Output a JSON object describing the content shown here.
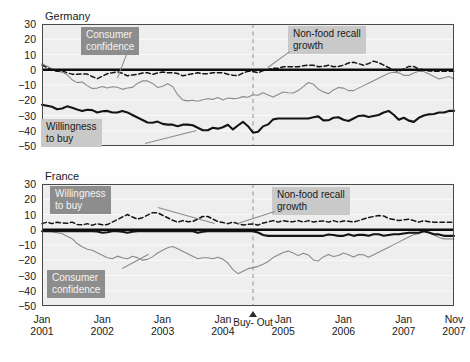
{
  "figure": {
    "panels": [
      {
        "id": "germany",
        "title": "Germany",
        "y_ticks": [
          "30",
          "20",
          "10",
          "0",
          "-10",
          "-20",
          "-30",
          "-40",
          "-50"
        ],
        "callouts": [
          {
            "name": "consumer-confidence-label",
            "text": "Consumer\nconfidence",
            "style": "dark"
          },
          {
            "name": "willingness-to-buy-label",
            "text": "Willingness\nto buy",
            "style": "light"
          },
          {
            "name": "non-food-recall-growth-label",
            "text": "Non-food recall\ngrowth",
            "style": "light"
          }
        ]
      },
      {
        "id": "france",
        "title": "France",
        "y_ticks": [
          "30",
          "20",
          "10",
          "0",
          "-10",
          "-20",
          "-30",
          "-40",
          "-50"
        ],
        "callouts": [
          {
            "name": "willingness-to-buy-label",
            "text": "Willingness\nto buy",
            "style": "dark"
          },
          {
            "name": "consumer-confidence-label",
            "text": "Consumer\nconfidence",
            "style": "dark"
          },
          {
            "name": "non-food-recall-growth-label",
            "text": "Non-food recall\ngrowth",
            "style": "light"
          }
        ]
      }
    ],
    "x_labels": [
      {
        "top": "Jan",
        "bottom": "2001"
      },
      {
        "top": "Jan",
        "bottom": "2002"
      },
      {
        "top": "Jan",
        "bottom": "2003"
      },
      {
        "top": "Jan",
        "bottom": "2004"
      },
      {
        "top": "Jan",
        "bottom": "2005"
      },
      {
        "top": "Jan",
        "bottom": "2006"
      },
      {
        "top": "Jan",
        "bottom": "2007"
      },
      {
        "top": "Nov",
        "bottom": "2007"
      }
    ],
    "event_marker": {
      "name": "buy-out-marker",
      "line1": "Buy-",
      "line2": "Out",
      "icon": "triangle-up-icon"
    },
    "colors": {
      "consumer_confidence": "#8a8a8a",
      "willingness_to_buy": "#141414",
      "non_food_recall_growth": "#141414",
      "zero_line": "#0d0d0d",
      "plot_background": "#eeeeee",
      "grid": "#fbfbfb",
      "callout_light": "#c9c9c9",
      "callout_dark": "#8d8d8d"
    }
  },
  "chart_data": {
    "type": "line",
    "xlabel": "",
    "ylabel": "",
    "ylim": [
      -50,
      30
    ],
    "ytick_step": 10,
    "grid": true,
    "legend": "inline-callout-labels",
    "x_unit": "month",
    "x_start": "2001-01",
    "x_end": "2007-11",
    "x_tick_labels": [
      "Jan 2001",
      "Jan 2002",
      "Jan 2003",
      "Jan 2004",
      "Jan 2005",
      "Jan 2006",
      "Jan 2007",
      "Nov 2007"
    ],
    "annotations": [
      {
        "label": "Buy-Out",
        "x": "2004-07",
        "type": "vertical-dashed-line-with-triangle-marker"
      }
    ],
    "panels": [
      {
        "name": "Germany",
        "series": [
          {
            "name": "Consumer confidence",
            "style": "thin-solid-gray",
            "values": [
              4,
              3,
              2,
              1,
              0,
              -1,
              -1,
              -2,
              -3,
              -5,
              -7,
              -8,
              -9,
              -8,
              -9,
              -11,
              -12,
              -13,
              -12,
              -11,
              -11,
              -12,
              -12,
              -11,
              -11,
              -12,
              -13,
              -12,
              -12,
              -12,
              -11,
              -9,
              -8,
              -7,
              -7,
              -8,
              -9,
              -11,
              -12,
              -11,
              -10,
              -9,
              -10,
              -12,
              -16,
              -19,
              -20,
              -20,
              -21,
              -20,
              -20,
              -21,
              -20,
              -19,
              -19,
              -20,
              -19,
              -18,
              -19,
              -20,
              -19,
              -18,
              -19,
              -18,
              -19,
              -18,
              -17,
              -18,
              -17,
              -16,
              -17,
              -16,
              -15,
              -16,
              -17,
              -18,
              -17,
              -16,
              -15,
              -14,
              -15,
              -16,
              -15,
              -14,
              -13,
              -11,
              -9,
              -8,
              -9,
              -11,
              -13,
              -14,
              -15,
              -16,
              -14,
              -13,
              -12,
              -11,
              -12,
              -13,
              -14,
              -14,
              -13,
              -12,
              -11,
              -10,
              -9,
              -8,
              -7,
              -6,
              -5,
              -4,
              -3,
              -2,
              -2,
              -1,
              -2,
              -3,
              -4,
              -4,
              -3,
              -2,
              -1,
              -1,
              -1,
              -2,
              -3,
              -4,
              -5,
              -6,
              -6,
              -5,
              -4,
              -5,
              -6
            ]
          },
          {
            "name": "Willingness to buy",
            "style": "thick-solid-black",
            "values": [
              -23,
              -23,
              -24,
              -24,
              -25,
              -26,
              -26,
              -25,
              -24,
              -24,
              -25,
              -26,
              -26,
              -27,
              -27,
              -26,
              -26,
              -27,
              -28,
              -28,
              -27,
              -27,
              -27,
              -28,
              -28,
              -28,
              -27,
              -27,
              -28,
              -29,
              -30,
              -31,
              -32,
              -33,
              -34,
              -35,
              -35,
              -34,
              -34,
              -35,
              -36,
              -36,
              -36,
              -36,
              -37,
              -37,
              -36,
              -36,
              -36,
              -36,
              -37,
              -38,
              -39,
              -40,
              -40,
              -39,
              -38,
              -38,
              -39,
              -38,
              -37,
              -36,
              -38,
              -40,
              -37,
              -35,
              -34,
              -36,
              -38,
              -41,
              -43,
              -40,
              -38,
              -36,
              -36,
              -34,
              -32,
              -32,
              -32,
              -32,
              -32,
              -32,
              -32,
              -32,
              -32,
              -32,
              -32,
              -32,
              -32,
              -31,
              -30,
              -31,
              -33,
              -34,
              -33,
              -32,
              -31,
              -31,
              -32,
              -33,
              -34,
              -33,
              -32,
              -31,
              -30,
              -30,
              -30,
              -31,
              -31,
              -30,
              -30,
              -29,
              -28,
              -27,
              -27,
              -29,
              -31,
              -33,
              -32,
              -31,
              -33,
              -35,
              -34,
              -32,
              -31,
              -30,
              -30,
              -29,
              -29,
              -29,
              -28,
              -28,
              -28,
              -27,
              -27,
              -27
            ]
          },
          {
            "name": "Non-food recall growth",
            "style": "dashed-black",
            "values": [
              3,
              2,
              1,
              0,
              -1,
              -1,
              0,
              -1,
              -2,
              -2,
              -3,
              -3,
              -3,
              -3,
              -2,
              -3,
              -4,
              -5,
              -6,
              -5,
              -4,
              -3,
              -2,
              -2,
              -2,
              -1,
              -2,
              -3,
              -4,
              -4,
              -3,
              -3,
              -3,
              -2,
              -2,
              -2,
              -3,
              -3,
              -2,
              -2,
              -1,
              -2,
              -2,
              -2,
              -2,
              -3,
              -4,
              -4,
              -3,
              -3,
              -2,
              -2,
              -2,
              -3,
              -3,
              -2,
              -2,
              -2,
              -2,
              -2,
              -2,
              -3,
              -3,
              -4,
              -4,
              -3,
              -2,
              -1,
              -1,
              -1,
              -2,
              -2,
              -1,
              0,
              0,
              1,
              1,
              1,
              1,
              2,
              2,
              2,
              2,
              2,
              2,
              2,
              3,
              3,
              3,
              3,
              2,
              2,
              2,
              3,
              3,
              2,
              2,
              2,
              3,
              3,
              4,
              5,
              5,
              4,
              4,
              3,
              3,
              4,
              5,
              6,
              5,
              4,
              3,
              2,
              1,
              0,
              -1,
              -1,
              0,
              1,
              2,
              3,
              2,
              1,
              0,
              0,
              0,
              -1,
              -1,
              -1,
              -1,
              -1,
              -1,
              -1,
              -1,
              -1
            ]
          }
        ]
      },
      {
        "name": "France",
        "series": [
          {
            "name": "Willingness to buy",
            "style": "thick-solid-black",
            "values": [
              -1,
              -1,
              -1,
              -1,
              -1,
              -1,
              -1,
              -1,
              -1,
              -1,
              -1,
              -1,
              -1,
              -1,
              -1,
              -1,
              -1,
              -1,
              -1,
              -2,
              -2,
              -2,
              -1,
              -1,
              -1,
              -1,
              -1,
              -2,
              -2,
              -2,
              -1,
              -1,
              -1,
              -1,
              -1,
              -1,
              -1,
              -1,
              -1,
              -1,
              -1,
              -1,
              -1,
              -1,
              -1,
              -1,
              -1,
              -1,
              -1,
              -1,
              -1,
              -2,
              -2,
              -1,
              -1,
              -1,
              -1,
              -1,
              -1,
              -1,
              -1,
              -1,
              -1,
              -1,
              -1,
              -1,
              -1,
              -1,
              -1,
              -1,
              -1,
              -2,
              -3,
              -4,
              -4,
              -4,
              -4,
              -4,
              -4,
              -4,
              -4,
              -4,
              -4,
              -4,
              -4,
              -4,
              -4,
              -4,
              -4,
              -4,
              -4,
              -4,
              -4,
              -4,
              -3,
              -3,
              -4,
              -4,
              -4,
              -4,
              -3,
              -3,
              -4,
              -4,
              -3,
              -3,
              -4,
              -4,
              -3,
              -3,
              -3,
              -3,
              -4,
              -4,
              -3,
              -3,
              -3,
              -3,
              -3,
              -2,
              -2,
              -2,
              -2,
              -2,
              -2,
              -1,
              -1,
              -2,
              -3,
              -3,
              -3,
              -4,
              -4,
              -4,
              -4,
              -4
            ]
          },
          {
            "name": "Consumer confidence",
            "style": "thin-solid-gray",
            "values": [
              -1,
              -1,
              -1,
              -1,
              -2,
              -2,
              -2,
              -3,
              -4,
              -5,
              -6,
              -8,
              -10,
              -11,
              -12,
              -13,
              -13,
              -14,
              -15,
              -16,
              -17,
              -18,
              -19,
              -19,
              -18,
              -17,
              -18,
              -19,
              -19,
              -18,
              -17,
              -18,
              -19,
              -20,
              -20,
              -19,
              -18,
              -17,
              -15,
              -14,
              -13,
              -12,
              -11,
              -11,
              -12,
              -13,
              -14,
              -15,
              -16,
              -17,
              -18,
              -19,
              -19,
              -18,
              -18,
              -19,
              -19,
              -18,
              -18,
              -19,
              -20,
              -22,
              -25,
              -27,
              -29,
              -28,
              -27,
              -26,
              -25,
              -25,
              -24,
              -24,
              -23,
              -22,
              -21,
              -19,
              -18,
              -17,
              -16,
              -15,
              -14,
              -14,
              -15,
              -16,
              -17,
              -16,
              -15,
              -16,
              -18,
              -20,
              -21,
              -20,
              -18,
              -17,
              -16,
              -17,
              -18,
              -17,
              -16,
              -15,
              -16,
              -17,
              -18,
              -17,
              -16,
              -16,
              -17,
              -18,
              -17,
              -16,
              -15,
              -14,
              -13,
              -12,
              -11,
              -10,
              -9,
              -8,
              -7,
              -6,
              -5,
              -4,
              -3,
              -3,
              -2,
              -1,
              -1,
              -2,
              -3,
              -4,
              -5,
              -6,
              -6,
              -6,
              -6,
              -6
            ]
          },
          {
            "name": "Non-food recall growth",
            "style": "dashed-black",
            "values": [
              4,
              5,
              5,
              4,
              4,
              5,
              5,
              4,
              4,
              5,
              5,
              4,
              3,
              3,
              4,
              4,
              3,
              3,
              4,
              4,
              3,
              3,
              4,
              5,
              6,
              7,
              8,
              9,
              10,
              9,
              8,
              7,
              7,
              8,
              9,
              10,
              11,
              12,
              11,
              10,
              9,
              8,
              7,
              6,
              5,
              5,
              6,
              6,
              5,
              5,
              6,
              7,
              8,
              9,
              9,
              8,
              7,
              6,
              5,
              5,
              4,
              4,
              5,
              5,
              4,
              4,
              3,
              3,
              4,
              4,
              3,
              3,
              4,
              5,
              5,
              6,
              6,
              5,
              5,
              6,
              6,
              5,
              5,
              6,
              6,
              5,
              5,
              6,
              6,
              5,
              5,
              6,
              6,
              5,
              5,
              6,
              6,
              5,
              5,
              6,
              6,
              5,
              5,
              6,
              6,
              7,
              7,
              8,
              8,
              9,
              9,
              10,
              9,
              8,
              7,
              7,
              6,
              6,
              6,
              7,
              7,
              6,
              6,
              5,
              5,
              6,
              6,
              5,
              5,
              5,
              5,
              5,
              5,
              5,
              5,
              5
            ]
          }
        ]
      }
    ]
  }
}
